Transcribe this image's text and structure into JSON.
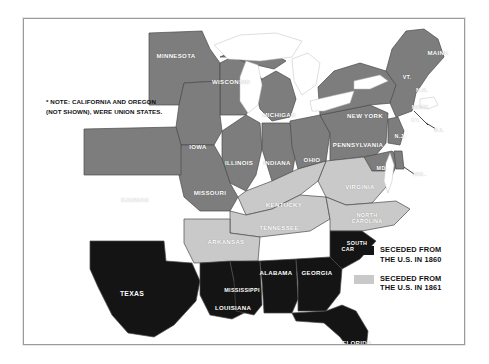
{
  "map": {
    "title": "U.S. Civil War Secession Map",
    "note": "* NOTE: CALIFORNIA AND OREGON (NOT SHOWN), WERE UNION STATES.",
    "colors": {
      "seceded_1860": "#141414",
      "seceded_1861": "#c9c9c9",
      "union": "#7d7d7d",
      "water": "#ffffff",
      "border": "#4a4a4a",
      "frame": "#9a9a9a",
      "label_text": "#ffffff"
    },
    "legend": {
      "items": [
        {
          "swatch": "dark",
          "line1": "SECEDED FROM",
          "line2": "THE U.S. IN 1860",
          "color": "#141414"
        },
        {
          "swatch": "light",
          "line1": "SECEDED FROM",
          "line2": "THE U.S. IN 1861",
          "color": "#c9c9c9"
        }
      ]
    },
    "states": [
      {
        "name": "MINNESOTA",
        "status": "union",
        "x": 152,
        "y": 36,
        "size": "s8"
      },
      {
        "name": "WISCONSIN",
        "status": "union",
        "x": 207,
        "y": 62,
        "size": "s8"
      },
      {
        "name": "MICHIGAN",
        "status": "union",
        "x": 255,
        "y": 95,
        "size": "s8"
      },
      {
        "name": "IOWA",
        "status": "union",
        "x": 174,
        "y": 127,
        "size": "s8"
      },
      {
        "name": "ILLINOIS",
        "status": "union",
        "x": 215,
        "y": 143,
        "size": "s8"
      },
      {
        "name": "INDIANA",
        "status": "union",
        "x": 253,
        "y": 143,
        "size": "s8"
      },
      {
        "name": "OHIO",
        "status": "union",
        "x": 288,
        "y": 140,
        "size": "s8"
      },
      {
        "name": "PENNSYLVANIA",
        "status": "union",
        "x": 334,
        "y": 125,
        "size": "s8"
      },
      {
        "name": "NEW YORK",
        "status": "union",
        "x": 341,
        "y": 96,
        "size": "s8"
      },
      {
        "name": "MAINE",
        "status": "union",
        "x": 414,
        "y": 33,
        "size": "s8"
      },
      {
        "name": "VT.",
        "status": "union",
        "x": 383,
        "y": 58,
        "size": "s7"
      },
      {
        "name": "N.H.",
        "status": "union",
        "x": 398,
        "y": 71,
        "size": "s7"
      },
      {
        "name": "MASS.",
        "status": "union",
        "x": 397,
        "y": 88,
        "size": "s7"
      },
      {
        "name": "CT.",
        "status": "union",
        "x": 392,
        "y": 101,
        "size": "s7"
      },
      {
        "name": "R.I.",
        "status": "union",
        "x": 415,
        "y": 111,
        "size": "s7"
      },
      {
        "name": "N.J.",
        "status": "union",
        "x": 376,
        "y": 117,
        "size": "s7"
      },
      {
        "name": "MD.",
        "status": "union",
        "x": 358,
        "y": 149,
        "size": "s7"
      },
      {
        "name": "DEL.",
        "status": "union",
        "x": 396,
        "y": 155,
        "size": "s7"
      },
      {
        "name": "KANSAS",
        "status": "union",
        "x": 111,
        "y": 180,
        "size": "s8"
      },
      {
        "name": "MISSOURI",
        "status": "union",
        "x": 186,
        "y": 173,
        "size": "s8"
      },
      {
        "name": "KENTUCKY",
        "status": "seceded_1861",
        "x": 260,
        "y": 185,
        "size": "s8"
      },
      {
        "name": "VIRGINIA",
        "status": "seceded_1861",
        "x": 336,
        "y": 167,
        "size": "s8"
      },
      {
        "name": "NORTH CAROLINA",
        "status": "seceded_1861",
        "x": 343,
        "y": 199,
        "size": "s7"
      },
      {
        "name": "TENNESSEE",
        "status": "seceded_1861",
        "x": 255,
        "y": 208,
        "size": "s8"
      },
      {
        "name": "ARKANSAS",
        "status": "seceded_1861",
        "x": 202,
        "y": 222,
        "size": "s8"
      },
      {
        "name": "SOUTH CAROLINA",
        "status": "seceded_1860",
        "x": 333,
        "y": 227,
        "size": "s7"
      },
      {
        "name": "TEXAS",
        "status": "seceded_1860",
        "x": 108,
        "y": 274,
        "size": "s9"
      },
      {
        "name": "LOUISIANA",
        "status": "seceded_1860",
        "x": 209,
        "y": 288,
        "size": "s8"
      },
      {
        "name": "MISSISSIPPI",
        "status": "seceded_1860",
        "x": 218,
        "y": 271,
        "size": "s7"
      },
      {
        "name": "ALABAMA",
        "status": "seceded_1860",
        "x": 252,
        "y": 253,
        "size": "s8"
      },
      {
        "name": "GEORGIA",
        "status": "seceded_1860",
        "x": 293,
        "y": 253,
        "size": "s8"
      },
      {
        "name": "FLORIDA",
        "status": "seceded_1860",
        "x": 333,
        "y": 323,
        "size": "s8"
      }
    ]
  }
}
